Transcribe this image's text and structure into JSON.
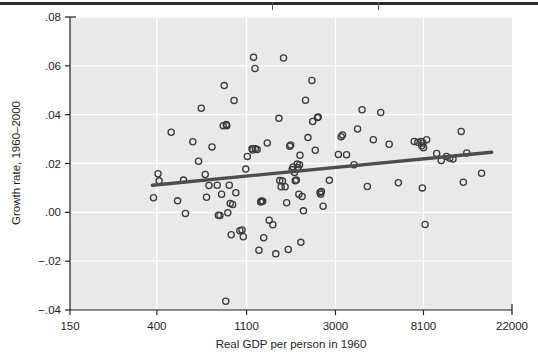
{
  "figure": {
    "top_rule": "page-rule",
    "background_color": "#ffffff",
    "plot_background_color": "#e9e9e9",
    "gridline_color": "#ffffff",
    "axis_color": "#231f20",
    "marker_color": "#3b3b3b",
    "fit_line_color": "#4d4d4d"
  },
  "chart_data": {
    "type": "scatter",
    "title": "",
    "xlabel": "Real GDP per person in 1960",
    "ylabel": "Growth rate, 1960–2000",
    "xscale": "log",
    "xlim": [
      150,
      22000
    ],
    "ylim": [
      -0.04,
      0.08
    ],
    "xticks": [
      150,
      400,
      1100,
      3000,
      8100,
      22000
    ],
    "xtick_labels": [
      "150",
      "400",
      "1100",
      "3000",
      "8100",
      "22000"
    ],
    "yticks": [
      -0.04,
      -0.02,
      0.0,
      0.02,
      0.04,
      0.06,
      0.08
    ],
    "ytick_labels": [
      "−.04",
      "−.02",
      ".00",
      ".02",
      ".04",
      ".06",
      ".08"
    ],
    "grid": true,
    "legend": "none",
    "series": [
      {
        "name": "Countries",
        "marker": "open-circle",
        "points": [
          [
            385,
            0.006
          ],
          [
            405,
            0.0158
          ],
          [
            410,
            0.0129
          ],
          [
            470,
            0.0328
          ],
          [
            505,
            0.0047
          ],
          [
            540,
            0.0132
          ],
          [
            552,
            -0.0005
          ],
          [
            600,
            0.0289
          ],
          [
            640,
            0.0209
          ],
          [
            660,
            0.0426
          ],
          [
            690,
            0.0155
          ],
          [
            700,
            0.0062
          ],
          [
            720,
            0.011
          ],
          [
            745,
            0.0268
          ],
          [
            790,
            0.0111
          ],
          [
            800,
            -0.0012
          ],
          [
            815,
            -0.0013
          ],
          [
            830,
            0.0074
          ],
          [
            845,
            0.0355
          ],
          [
            855,
            0.0519
          ],
          [
            875,
            0.036
          ],
          [
            880,
            0.0355
          ],
          [
            890,
            -0.0002
          ],
          [
            905,
            0.0111
          ],
          [
            915,
            0.0036
          ],
          [
            925,
            -0.0092
          ],
          [
            940,
            0.0032
          ],
          [
            955,
            0.0458
          ],
          [
            975,
            0.008
          ],
          [
            1020,
            -0.0075
          ],
          [
            1045,
            -0.0072
          ],
          [
            1060,
            -0.01
          ],
          [
            1090,
            0.0177
          ],
          [
            1110,
            0.0229
          ],
          [
            1170,
            0.026
          ],
          [
            1180,
            0.0255
          ],
          [
            1190,
            0.0635
          ],
          [
            1210,
            0.0589
          ],
          [
            1215,
            0.026
          ],
          [
            1240,
            0.0257
          ],
          [
            1265,
            -0.0155
          ],
          [
            1290,
            0.0042
          ],
          [
            1300,
            0.0046
          ],
          [
            1320,
            0.0045
          ],
          [
            1335,
            -0.0104
          ],
          [
            1390,
            0.0284
          ],
          [
            1420,
            -0.0032
          ],
          [
            1480,
            -0.0051
          ],
          [
            1530,
            -0.017
          ],
          [
            1585,
            0.0385
          ],
          [
            1600,
            0.013
          ],
          [
            1625,
            0.0105
          ],
          [
            1650,
            0.0128
          ],
          [
            1670,
            0.0632
          ],
          [
            1700,
            0.0105
          ],
          [
            1730,
            0.0039
          ],
          [
            1760,
            -0.0152
          ],
          [
            1790,
            0.0271
          ],
          [
            1810,
            0.0276
          ],
          [
            1840,
            0.0175
          ],
          [
            1860,
            0.0186
          ],
          [
            1890,
            0.0163
          ],
          [
            1905,
            0.0129
          ],
          [
            1930,
            0.0132
          ],
          [
            1950,
            0.0198
          ],
          [
            1965,
            0.0183
          ],
          [
            1985,
            0.0074
          ],
          [
            2000,
            0.0195
          ],
          [
            2010,
            0.0234
          ],
          [
            2030,
            -0.0123
          ],
          [
            2060,
            0.0065
          ],
          [
            2090,
            0.0006
          ],
          [
            2140,
            0.0459
          ],
          [
            2200,
            0.0306
          ],
          [
            2300,
            0.054
          ],
          [
            2320,
            0.0372
          ],
          [
            2390,
            0.0254
          ],
          [
            2450,
            0.0388
          ],
          [
            2470,
            0.039
          ],
          [
            2520,
            0.0081
          ],
          [
            2540,
            0.0074
          ],
          [
            2560,
            0.0085
          ],
          [
            2610,
            0.0025
          ],
          [
            2800,
            0.0131
          ],
          [
            3100,
            0.0237
          ],
          [
            3200,
            0.031
          ],
          [
            3250,
            0.0317
          ],
          [
            3400,
            0.0236
          ],
          [
            3700,
            0.0195
          ],
          [
            3850,
            0.0341
          ],
          [
            4050,
            0.042
          ],
          [
            4300,
            0.0106
          ],
          [
            4600,
            0.0297
          ],
          [
            5000,
            0.0409
          ],
          [
            5500,
            0.0279
          ],
          [
            6100,
            0.0121
          ],
          [
            7300,
            0.029
          ],
          [
            7600,
            0.0287
          ],
          [
            7900,
            0.029
          ],
          [
            7950,
            0.0273
          ],
          [
            8000,
            0.01
          ],
          [
            8050,
            0.0284
          ],
          [
            8100,
            0.0265
          ],
          [
            8250,
            -0.005
          ],
          [
            8400,
            0.0297
          ],
          [
            9400,
            0.0241
          ],
          [
            9900,
            0.0212
          ],
          [
            10500,
            0.0229
          ],
          [
            10900,
            0.0221
          ],
          [
            11300,
            0.0218
          ],
          [
            12400,
            0.0331
          ],
          [
            12700,
            0.0123
          ],
          [
            13200,
            0.0243
          ],
          [
            15600,
            0.016
          ],
          [
            870,
            -0.0364
          ]
        ]
      }
    ],
    "fit_line": {
      "name": "Regression line",
      "x_start": 380,
      "y_start": 0.0111,
      "x_end": 17500,
      "y_end": 0.0246,
      "color": "#4d4d4d"
    }
  }
}
